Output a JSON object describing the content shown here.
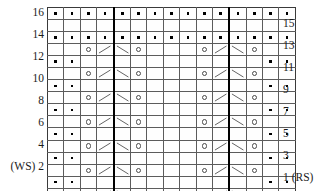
{
  "chart_data": {
    "type": "table",
    "columns": 15,
    "rows": 16,
    "grid_on": true,
    "repeat_marker_after_columns": [
      4,
      11
    ],
    "symbol_legend": {
      "dot": "purl",
      "yo": "yarn over",
      "k2tog": "knit 2 together (right-leaning decrease)",
      "ssk": "slip slip knit (left-leaning decrease)",
      "empty": "knit"
    },
    "row_labels_left": [
      {
        "row": 16,
        "label": "16"
      },
      {
        "row": 14,
        "label": "14"
      },
      {
        "row": 12,
        "label": "12"
      },
      {
        "row": 10,
        "label": "10"
      },
      {
        "row": 8,
        "label": "8"
      },
      {
        "row": 6,
        "label": "6"
      },
      {
        "row": 4,
        "label": "4"
      },
      {
        "row": 2,
        "label": "(WS) 2"
      }
    ],
    "row_labels_right": [
      {
        "row": 15,
        "label": "15"
      },
      {
        "row": 13,
        "label": "13"
      },
      {
        "row": 11,
        "label": "11"
      },
      {
        "row": 9,
        "label": "9"
      },
      {
        "row": 7,
        "label": "7"
      },
      {
        "row": 5,
        "label": "5"
      },
      {
        "row": 3,
        "label": "3"
      },
      {
        "row": 1,
        "label": "1 (RS)"
      }
    ],
    "rows_top_to_bottom": [
      {
        "row": 16,
        "cells": [
          "dot",
          "dot",
          "dot",
          "dot",
          "dot",
          "dot",
          "dot",
          "dot",
          "dot",
          "dot",
          "dot",
          "dot",
          "dot",
          "dot",
          "dot"
        ]
      },
      {
        "row": 15,
        "cells": [
          "",
          "",
          "",
          "",
          "",
          "",
          "",
          "",
          "",
          "",
          "",
          "",
          "",
          "",
          ""
        ]
      },
      {
        "row": 14,
        "cells": [
          "dot",
          "dot",
          "dot",
          "dot",
          "dot",
          "dot",
          "dot",
          "dot",
          "dot",
          "dot",
          "dot",
          "dot",
          "dot",
          "dot",
          "dot"
        ]
      },
      {
        "row": 13,
        "cells": [
          "",
          "",
          "yo",
          "k2tog",
          "ssk",
          "yo",
          "",
          "",
          "",
          "yo",
          "k2tog",
          "ssk",
          "yo",
          "",
          ""
        ]
      },
      {
        "row": 12,
        "cells": [
          "dot",
          "dot",
          "",
          "",
          "",
          "",
          "",
          "",
          "",
          "",
          "",
          "",
          "",
          "dot",
          "dot"
        ]
      },
      {
        "row": 11,
        "cells": [
          "",
          "",
          "yo",
          "k2tog",
          "ssk",
          "yo",
          "",
          "",
          "",
          "yo",
          "k2tog",
          "ssk",
          "yo",
          "",
          ""
        ]
      },
      {
        "row": 10,
        "cells": [
          "dot",
          "dot",
          "",
          "",
          "",
          "",
          "",
          "",
          "",
          "",
          "",
          "",
          "",
          "dot",
          "dot"
        ]
      },
      {
        "row": 9,
        "cells": [
          "",
          "",
          "yo",
          "k2tog",
          "ssk",
          "yo",
          "",
          "",
          "",
          "yo",
          "k2tog",
          "ssk",
          "yo",
          "",
          ""
        ]
      },
      {
        "row": 8,
        "cells": [
          "dot",
          "dot",
          "",
          "",
          "",
          "",
          "",
          "",
          "",
          "",
          "",
          "",
          "",
          "dot",
          "dot"
        ]
      },
      {
        "row": 7,
        "cells": [
          "",
          "",
          "yo",
          "k2tog",
          "ssk",
          "yo",
          "",
          "",
          "",
          "yo",
          "k2tog",
          "ssk",
          "yo",
          "",
          ""
        ]
      },
      {
        "row": 6,
        "cells": [
          "dot",
          "dot",
          "",
          "",
          "",
          "",
          "",
          "",
          "",
          "",
          "",
          "",
          "",
          "dot",
          "dot"
        ]
      },
      {
        "row": 5,
        "cells": [
          "",
          "",
          "yo",
          "k2tog",
          "ssk",
          "yo",
          "",
          "",
          "",
          "yo",
          "k2tog",
          "ssk",
          "yo",
          "",
          ""
        ]
      },
      {
        "row": 4,
        "cells": [
          "dot",
          "dot",
          "",
          "",
          "",
          "",
          "",
          "",
          "",
          "",
          "",
          "",
          "",
          "dot",
          "dot"
        ]
      },
      {
        "row": 3,
        "cells": [
          "",
          "",
          "yo",
          "k2tog",
          "ssk",
          "yo",
          "",
          "",
          "",
          "yo",
          "k2tog",
          "ssk",
          "yo",
          "",
          ""
        ]
      },
      {
        "row": 2,
        "cells": [
          "dot",
          "dot",
          "",
          "",
          "",
          "",
          "",
          "",
          "",
          "",
          "",
          "",
          "",
          "dot",
          "dot"
        ]
      },
      {
        "row": 1,
        "cells": [
          "",
          "",
          "yo",
          "k2tog",
          "ssk",
          "yo",
          "",
          "",
          "",
          "yo",
          "k2tog",
          "ssk",
          "yo",
          "",
          ""
        ]
      }
    ]
  },
  "colors": {
    "grid_line": "#5b5b5b",
    "repeat_line": "#000000",
    "symbol": "#4a4a4a",
    "dot": "#000000",
    "text": "#1b1b1b",
    "background": "#ffffff"
  }
}
